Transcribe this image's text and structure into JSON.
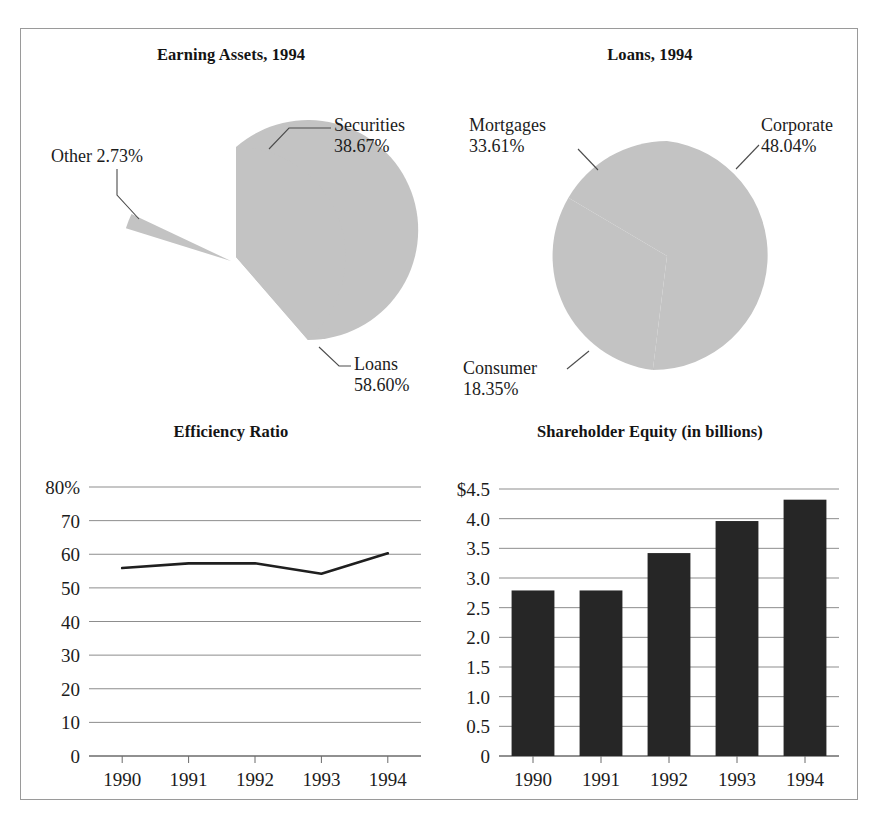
{
  "figure": {
    "background": "#ffffff",
    "border_color": "#9a9a9a",
    "pie_fill": "#c3c3c3",
    "bar_fill": "#262626",
    "line_color": "#1f1f1f",
    "grid_color": "#8d8d8d"
  },
  "panels": {
    "earning_assets": {
      "title": "Earning Assets, 1994",
      "labels": {
        "securities_name": "Securities",
        "securities_value": "38.67%",
        "other": "Other 2.73%",
        "loans_name": "Loans",
        "loans_value": "58.60%"
      }
    },
    "loans": {
      "title": "Loans, 1994",
      "labels": {
        "mortgages_name": "Mortgages",
        "mortgages_value": "33.61%",
        "corporate_name": "Corporate",
        "corporate_value": "48.04%",
        "consumer_name": "Consumer",
        "consumer_value": "18.35%"
      }
    },
    "efficiency": {
      "title": "Efficiency Ratio"
    },
    "equity": {
      "title": "Shareholder Equity (in billions)"
    }
  },
  "chart_data": [
    {
      "type": "pie",
      "title": "Earning Assets, 1994",
      "labels": [
        "Securities",
        "Loans",
        "Other"
      ],
      "values": [
        38.67,
        58.6,
        2.73
      ],
      "value_labels": [
        "38.67%",
        "58.60%",
        "2.73%"
      ],
      "exploded": [
        false,
        false,
        true
      ],
      "start_angle_deg": 0,
      "direction": "clockwise",
      "legend": "callout-labels"
    },
    {
      "type": "pie",
      "title": "Loans, 1994",
      "labels": [
        "Corporate",
        "Consumer",
        "Mortgages"
      ],
      "values": [
        48.04,
        18.35,
        33.61
      ],
      "value_labels": [
        "48.04%",
        "18.35%",
        "33.61%"
      ],
      "exploded": [
        false,
        false,
        false
      ],
      "start_angle_deg": 0,
      "direction": "clockwise",
      "legend": "callout-labels"
    },
    {
      "type": "line",
      "title": "Efficiency Ratio",
      "categories": [
        "1990",
        "1991",
        "1992",
        "1993",
        "1994"
      ],
      "values": [
        55.9,
        57.3,
        57.3,
        54.2,
        60.3
      ],
      "xlabel": "",
      "ylabel": "",
      "ylim": [
        0,
        80
      ],
      "yticks": [
        0,
        10,
        20,
        30,
        40,
        50,
        60,
        70,
        80
      ],
      "ytick_labels": [
        "0",
        "10",
        "20",
        "30",
        "40",
        "50",
        "60",
        "70",
        "80%"
      ],
      "grid": true,
      "legend": "none"
    },
    {
      "type": "bar",
      "title": "Shareholder Equity (in billions)",
      "categories": [
        "1990",
        "1991",
        "1992",
        "1993",
        "1994"
      ],
      "values": [
        2.79,
        2.79,
        3.42,
        3.96,
        4.32
      ],
      "xlabel": "",
      "ylabel": "",
      "ylim": [
        0,
        4.5
      ],
      "yticks": [
        0,
        0.5,
        1.0,
        1.5,
        2.0,
        2.5,
        3.0,
        3.5,
        4.0,
        4.5
      ],
      "ytick_labels": [
        "0",
        "0.5",
        "1.0",
        "1.5",
        "2.0",
        "2.5",
        "3.0",
        "3.5",
        "4.0",
        "$4.5"
      ],
      "grid": true,
      "legend": "none"
    }
  ]
}
